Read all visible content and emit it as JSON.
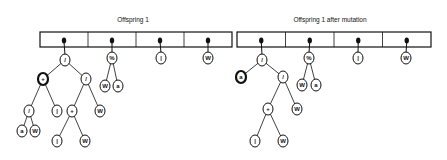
{
  "colors": {
    "ink": "#111111",
    "background": "#ffffff"
  },
  "panels": [
    {
      "title": "Offspring 1",
      "title_pos": [
        133,
        22
      ],
      "box": {
        "x": 40,
        "y": 32,
        "w": 192,
        "h": 15,
        "cells": 4
      },
      "nodes": [
        {
          "id": "r1",
          "label": "/",
          "x": 65,
          "y": 60,
          "bold": false
        },
        {
          "id": "p1",
          "label": "+",
          "x": 43,
          "y": 79,
          "bold": true
        },
        {
          "id": "d1",
          "label": "/",
          "x": 86,
          "y": 79,
          "bold": false
        },
        {
          "id": "d2",
          "label": "/",
          "x": 29,
          "y": 111,
          "bold": false
        },
        {
          "id": "i1",
          "label": "|",
          "x": 57,
          "y": 111,
          "bold": false
        },
        {
          "id": "a1",
          "label": "a",
          "x": 22,
          "y": 131,
          "bold": false
        },
        {
          "id": "w1",
          "label": "W",
          "x": 35,
          "y": 131,
          "bold": false
        },
        {
          "id": "p2",
          "label": "+",
          "x": 72,
          "y": 111,
          "bold": false
        },
        {
          "id": "w2",
          "label": "W",
          "x": 100,
          "y": 111,
          "bold": false
        },
        {
          "id": "i2",
          "label": "|",
          "x": 57,
          "y": 141,
          "bold": false
        },
        {
          "id": "w3",
          "label": "W",
          "x": 85,
          "y": 141,
          "bold": false
        },
        {
          "id": "m1",
          "label": "%",
          "x": 112,
          "y": 58,
          "bold": false
        },
        {
          "id": "w4",
          "label": "W",
          "x": 105,
          "y": 86,
          "bold": false
        },
        {
          "id": "a2",
          "label": "a",
          "x": 118,
          "y": 86,
          "bold": false
        },
        {
          "id": "i3",
          "label": "|",
          "x": 161,
          "y": 58,
          "bold": false
        },
        {
          "id": "w5",
          "label": "W",
          "x": 208,
          "y": 58,
          "bold": false
        }
      ],
      "edges": [
        [
          "r1",
          "p1"
        ],
        [
          "r1",
          "d1"
        ],
        [
          "p1",
          "d2"
        ],
        [
          "p1",
          "i1"
        ],
        [
          "d2",
          "a1"
        ],
        [
          "d2",
          "w1"
        ],
        [
          "d1",
          "p2"
        ],
        [
          "d1",
          "w2"
        ],
        [
          "p2",
          "i2"
        ],
        [
          "p2",
          "w3"
        ],
        [
          "m1",
          "w4"
        ],
        [
          "m1",
          "a2"
        ]
      ],
      "roots": [
        "r1",
        "m1",
        "i3",
        "w5"
      ]
    },
    {
      "title": "Offspring 1 after mutation",
      "title_pos": [
        330,
        22
      ],
      "box": {
        "x": 237,
        "y": 32,
        "w": 194,
        "h": 15,
        "cells": 4
      },
      "nodes": [
        {
          "id": "r1",
          "label": "/",
          "x": 262,
          "y": 60,
          "bold": false
        },
        {
          "id": "a0",
          "label": "a",
          "x": 241,
          "y": 77,
          "bold": true
        },
        {
          "id": "d1",
          "label": "/",
          "x": 283,
          "y": 77,
          "bold": false
        },
        {
          "id": "p2",
          "label": "+",
          "x": 268,
          "y": 109,
          "bold": false
        },
        {
          "id": "w2",
          "label": "W",
          "x": 297,
          "y": 109,
          "bold": false
        },
        {
          "id": "i2",
          "label": "|",
          "x": 255,
          "y": 141,
          "bold": false
        },
        {
          "id": "w3",
          "label": "W",
          "x": 283,
          "y": 141,
          "bold": false
        },
        {
          "id": "m1",
          "label": "%",
          "x": 309,
          "y": 58,
          "bold": false
        },
        {
          "id": "w4",
          "label": "W",
          "x": 302,
          "y": 85,
          "bold": false
        },
        {
          "id": "a2",
          "label": "a",
          "x": 316,
          "y": 85,
          "bold": false
        },
        {
          "id": "i3",
          "label": "|",
          "x": 358,
          "y": 58,
          "bold": false
        },
        {
          "id": "w5",
          "label": "W",
          "x": 406,
          "y": 58,
          "bold": false
        }
      ],
      "edges": [
        [
          "r1",
          "a0"
        ],
        [
          "r1",
          "d1"
        ],
        [
          "d1",
          "p2"
        ],
        [
          "d1",
          "w2"
        ],
        [
          "p2",
          "i2"
        ],
        [
          "p2",
          "w3"
        ],
        [
          "m1",
          "w4"
        ],
        [
          "m1",
          "a2"
        ]
      ],
      "roots": [
        "r1",
        "m1",
        "i3",
        "w5"
      ]
    }
  ]
}
